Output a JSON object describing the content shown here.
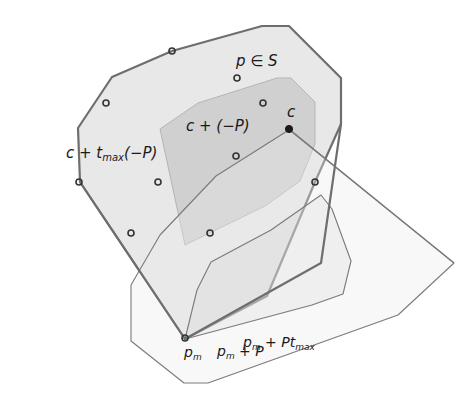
{
  "figure": {
    "type": "geometric-diagram",
    "background": "#ffffff",
    "colors": {
      "outer_fill": "#e6e6e6",
      "inner_fill": "#cfcfcf",
      "overlap_fill": "#c4c4c4",
      "bold_stroke": "#6e6e6e",
      "thin_stroke": "#7a7a7a",
      "point_stroke": "#333333",
      "center_fill": "#1a1a1a",
      "label": "#1a1a1a"
    },
    "labels": {
      "set": "p ∈ S",
      "scaled_reflection_prefix": "c + t",
      "scaled_reflection_sub": "max",
      "scaled_reflection_suffix": "(−P)",
      "reflection": "c + (−P)",
      "center": "c",
      "pm": "p",
      "pm_sub": "m",
      "pm_plus_p_prefix": "p",
      "pm_plus_p_sub": "m",
      "pm_plus_p_suffix": " + P",
      "pm_plus_pt_prefix": "p",
      "pm_plus_pt_sub": "m",
      "pm_plus_pt_mid": " + Pt",
      "pm_plus_pt_sub2": "max"
    },
    "polygons": {
      "outer_c_tmax_neg_P": "78,128 112,77 172,51 262,26 289,26 341,78 341,124 315,182 267,296 185,339 80,182",
      "inner_c_neg_P": "160,129 198,103 277,78 291,78 315,102 315,144 300,181 265,206 185,245",
      "pm_plus_P": "185,339 197,290 211,262 271,230 321,195 332,209 351,261 343,294 312,305 189,338",
      "pm_plus_Ptmax": "287,128 454,263 398,315 208,383 184,383 131,341 131,285 160,235 216,176 292,128"
    },
    "points": [
      {
        "name": "p-in-S",
        "x": 237,
        "y": 78,
        "filled": false
      },
      {
        "name": "boundary-top",
        "x": 172,
        "y": 51,
        "filled": false
      },
      {
        "name": "interior-left",
        "x": 106,
        "y": 103,
        "filled": false
      },
      {
        "name": "interior-upper",
        "x": 263,
        "y": 103,
        "filled": false
      },
      {
        "name": "interior-mid",
        "x": 236,
        "y": 156,
        "filled": false
      },
      {
        "name": "boundary-left",
        "x": 79,
        "y": 182,
        "filled": false
      },
      {
        "name": "interior-lower-left",
        "x": 158,
        "y": 182,
        "filled": false
      },
      {
        "name": "boundary-right",
        "x": 315,
        "y": 182,
        "filled": false
      },
      {
        "name": "boundary-lower-left",
        "x": 131,
        "y": 233,
        "filled": false
      },
      {
        "name": "interior-lower",
        "x": 210,
        "y": 233,
        "filled": false
      },
      {
        "name": "pm",
        "x": 185,
        "y": 338,
        "filled": false
      },
      {
        "name": "c",
        "x": 289,
        "y": 129,
        "filled": true
      }
    ]
  }
}
